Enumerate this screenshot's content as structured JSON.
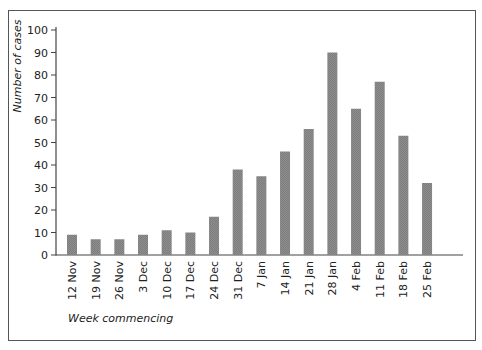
{
  "chart_data": {
    "type": "bar",
    "title": "",
    "xlabel": "Week commencing",
    "ylabel": "Number of cases",
    "ylim": [
      0,
      100
    ],
    "yticks": [
      0,
      10,
      20,
      30,
      40,
      50,
      60,
      70,
      80,
      90,
      100
    ],
    "grid": false,
    "legend": null,
    "categories": [
      "12 Nov",
      "19 Nov",
      "26 Nov",
      "3 Dec",
      "10 Dec",
      "17 Dec",
      "24 Dec",
      "31 Dec",
      "7 Jan",
      "14 Jan",
      "21 Jan",
      "28 Jan",
      "4 Feb",
      "11 Feb",
      "18 Feb",
      "25 Feb"
    ],
    "values": [
      9,
      7,
      7,
      9,
      11,
      10,
      17,
      38,
      35,
      46,
      56,
      90,
      65,
      77,
      53,
      32
    ],
    "bar_color": "#8c8c8c"
  }
}
